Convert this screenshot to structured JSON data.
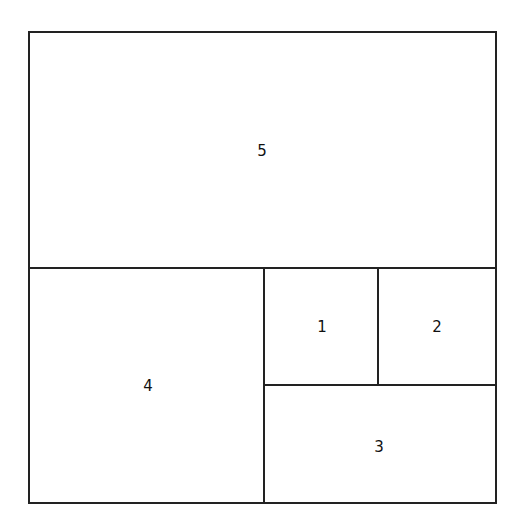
{
  "diagram": {
    "regions": [
      {
        "id": "1",
        "label": "1"
      },
      {
        "id": "2",
        "label": "2"
      },
      {
        "id": "3",
        "label": "3"
      },
      {
        "id": "4",
        "label": "4"
      },
      {
        "id": "5",
        "label": "5"
      }
    ]
  }
}
